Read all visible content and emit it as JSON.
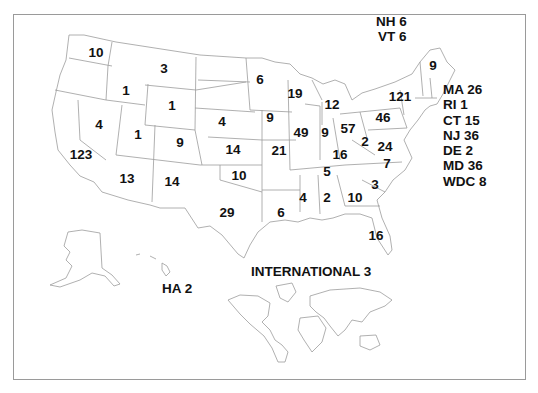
{
  "map": {
    "type": "choropleth-count-map",
    "region": "United States",
    "states": [
      {
        "state": "WA",
        "value": "10",
        "x": 96,
        "y": 53
      },
      {
        "state": "MT",
        "value": "3",
        "x": 164,
        "y": 69
      },
      {
        "state": "ID",
        "value": "1",
        "x": 126,
        "y": 91
      },
      {
        "state": "WY",
        "value": "1",
        "x": 172,
        "y": 106
      },
      {
        "state": "NV",
        "value": "4",
        "x": 99,
        "y": 125
      },
      {
        "state": "UT",
        "value": "1",
        "x": 138,
        "y": 135
      },
      {
        "state": "CO",
        "value": "9",
        "x": 180,
        "y": 143
      },
      {
        "state": "CA",
        "value": "123",
        "x": 81,
        "y": 155
      },
      {
        "state": "AZ",
        "value": "13",
        "x": 127,
        "y": 179
      },
      {
        "state": "NM",
        "value": "14",
        "x": 172,
        "y": 182
      },
      {
        "state": "ND",
        "value": "6",
        "x": 260,
        "y": 80
      },
      {
        "state": "NE",
        "value": "4",
        "x": 222,
        "y": 122
      },
      {
        "state": "KS",
        "value": "14",
        "x": 233,
        "y": 150
      },
      {
        "state": "OK",
        "value": "10",
        "x": 239,
        "y": 176
      },
      {
        "state": "TX",
        "value": "29",
        "x": 227,
        "y": 213
      },
      {
        "state": "IA",
        "value": "9",
        "x": 270,
        "y": 118
      },
      {
        "state": "MO",
        "value": "21",
        "x": 279,
        "y": 151
      },
      {
        "state": "LA",
        "value": "6",
        "x": 281,
        "y": 213
      },
      {
        "state": "WI",
        "value": "19",
        "x": 295,
        "y": 94
      },
      {
        "state": "IL",
        "value": "49",
        "x": 301,
        "y": 133
      },
      {
        "state": "MI",
        "value": "12",
        "x": 332,
        "y": 105
      },
      {
        "state": "IN",
        "value": "9",
        "x": 325,
        "y": 133
      },
      {
        "state": "OH",
        "value": "57",
        "x": 348,
        "y": 129
      },
      {
        "state": "KY",
        "value": "16",
        "x": 340,
        "y": 155
      },
      {
        "state": "TN",
        "value": "5",
        "x": 327,
        "y": 172
      },
      {
        "state": "MS",
        "value": "4",
        "x": 303,
        "y": 198
      },
      {
        "state": "AL",
        "value": "2",
        "x": 327,
        "y": 198
      },
      {
        "state": "GA",
        "value": "10",
        "x": 355,
        "y": 198
      },
      {
        "state": "FL",
        "value": "16",
        "x": 376,
        "y": 236
      },
      {
        "state": "SC",
        "value": "3",
        "x": 375,
        "y": 185
      },
      {
        "state": "NC",
        "value": "7",
        "x": 387,
        "y": 164
      },
      {
        "state": "WV",
        "value": "2",
        "x": 365,
        "y": 142
      },
      {
        "state": "VA",
        "value": "24",
        "x": 385,
        "y": 147
      },
      {
        "state": "PA",
        "value": "46",
        "x": 383,
        "y": 118
      },
      {
        "state": "NY",
        "value": "121",
        "x": 400,
        "y": 97
      },
      {
        "state": "ME",
        "value": "9",
        "x": 433,
        "y": 66
      }
    ],
    "callouts_top": [
      {
        "label": "NH 6"
      },
      {
        "label": "VT 6"
      }
    ],
    "callouts_side": [
      {
        "label": "MA 26"
      },
      {
        "label": "RI 1"
      },
      {
        "label": "CT 15"
      },
      {
        "label": "NJ 36"
      },
      {
        "label": "DE 2"
      },
      {
        "label": "MD 36"
      },
      {
        "label": "WDC 8"
      }
    ],
    "hawaii": {
      "label": "HA 2"
    },
    "international": {
      "label": "INTERNATIONAL 3"
    }
  }
}
